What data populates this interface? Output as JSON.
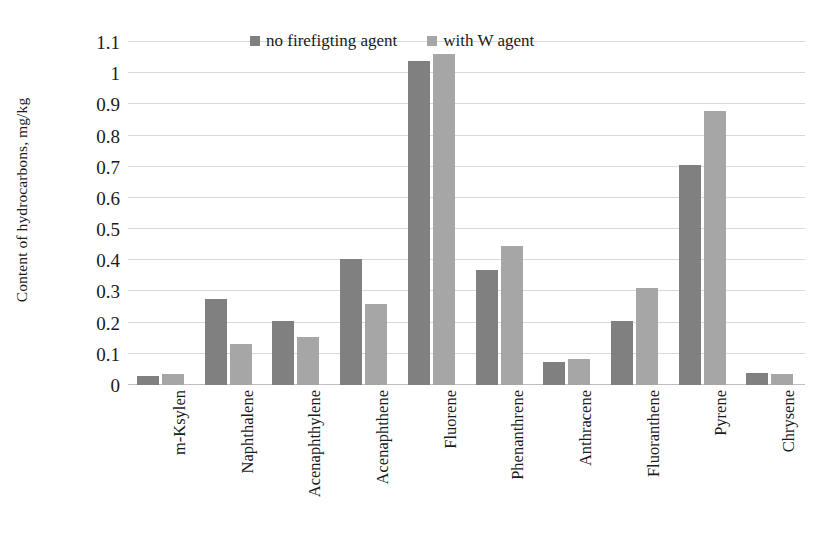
{
  "chart_data": {
    "type": "bar",
    "title": "",
    "xlabel": "",
    "ylabel": "Content of hydrocarbons, mg/kg",
    "ylim": [
      0,
      1.1
    ],
    "yticks": [
      0,
      0.1,
      0.2,
      0.3,
      0.4,
      0.5,
      0.6,
      0.7,
      0.8,
      0.9,
      1,
      1.1
    ],
    "ytick_labels": [
      "0",
      "0.1",
      "0.2",
      "0.3",
      "0.4",
      "0.5",
      "0.6",
      "0.7",
      "0.8",
      "0.9",
      "1",
      "1.1"
    ],
    "grid": true,
    "legend_position": "top-center",
    "categories": [
      "m-Ksylen",
      "Naphthalene",
      "Acenaphthylene",
      "Acenaphthene",
      "Fluorene",
      "Phenanthrene",
      "Anthracene",
      "Fluoranthene",
      "Pyrene",
      "Chrysene"
    ],
    "series": [
      {
        "name": "no firefigting agent",
        "color": "#808080",
        "values": [
          0.03,
          0.275,
          0.205,
          0.405,
          1.04,
          0.37,
          0.075,
          0.205,
          0.705,
          0.04
        ]
      },
      {
        "name": "with W agent",
        "color": "#a6a6a6",
        "values": [
          0.035,
          0.13,
          0.155,
          0.26,
          1.06,
          0.445,
          0.085,
          0.31,
          0.88,
          0.035
        ]
      }
    ]
  },
  "colors": {
    "series_dark": "#808080",
    "series_light": "#a6a6a6",
    "gridline": "#d9d9d9",
    "axis": "#bfbfbf",
    "text": "#1a1a1a",
    "background": "#ffffff"
  }
}
